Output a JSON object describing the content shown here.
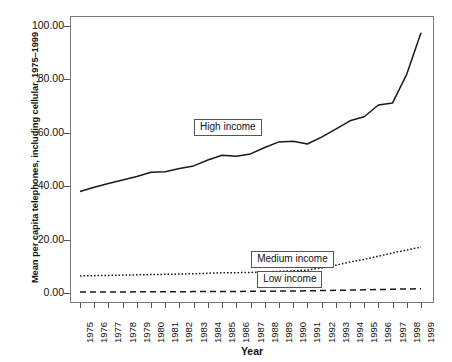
{
  "chart_data": {
    "type": "line",
    "title": "",
    "xlabel": "Year",
    "ylabel": "Mean per capita telephones, including cellular, 1975–1999",
    "xlim": [
      1975,
      1999
    ],
    "ylim": [
      0,
      100
    ],
    "grid": false,
    "legend_position": "inline-callout",
    "x": [
      1975,
      1976,
      1977,
      1978,
      1979,
      1980,
      1981,
      1982,
      1983,
      1984,
      1985,
      1986,
      1987,
      1988,
      1989,
      1990,
      1991,
      1992,
      1993,
      1994,
      1995,
      1996,
      1997,
      1998,
      1999
    ],
    "ytick_labels": [
      "0.00",
      "20.00",
      "40.00",
      "60.00",
      "80.00",
      "100.00"
    ],
    "ytick_values": [
      0,
      20,
      40,
      60,
      80,
      100
    ],
    "xtick_labels": [
      "1975",
      "1976",
      "1977",
      "1978",
      "1979",
      "1980",
      "1981",
      "1982",
      "1983",
      "1984",
      "1985",
      "1986",
      "1987",
      "1988",
      "1989",
      "1990",
      "1991",
      "1992",
      "1993",
      "1994",
      "1995",
      "1996",
      "1997",
      "1998",
      "1999"
    ],
    "series": [
      {
        "name": "High income",
        "label": "High income",
        "line_style": "solid",
        "color": "#1a1a1a",
        "values": [
          38.0,
          39.6,
          41.0,
          42.3,
          43.6,
          45.2,
          45.4,
          46.6,
          47.6,
          49.8,
          51.6,
          51.2,
          52.1,
          54.5,
          56.6,
          56.8,
          55.8,
          58.4,
          61.4,
          64.5,
          66.0,
          70.4,
          71.2,
          82.0,
          97.5
        ]
      },
      {
        "name": "Medium income",
        "label": "Medium income",
        "line_style": "dotted",
        "color": "#1a1a1a",
        "values": [
          6.4,
          6.5,
          6.6,
          6.7,
          6.8,
          6.9,
          7.0,
          7.1,
          7.2,
          7.4,
          7.6,
          7.6,
          7.7,
          7.9,
          8.1,
          8.3,
          8.6,
          9.4,
          10.4,
          11.6,
          12.6,
          13.8,
          15.0,
          16.1,
          17.2
        ]
      },
      {
        "name": "Low income",
        "label": "Low income",
        "line_style": "dashed",
        "color": "#1a1a1a",
        "values": [
          0.35,
          0.37,
          0.39,
          0.41,
          0.43,
          0.45,
          0.47,
          0.49,
          0.52,
          0.55,
          0.58,
          0.6,
          0.63,
          0.67,
          0.7,
          0.75,
          0.82,
          0.9,
          1.0,
          1.1,
          1.2,
          1.3,
          1.4,
          1.5,
          1.6
        ]
      }
    ]
  },
  "axis": {
    "y_title": "Mean per capita telephones, including cellular, 1975–1999",
    "x_title": "Year"
  },
  "callouts": {
    "high": "High income",
    "medium": "Medium income",
    "low": "Low income"
  }
}
